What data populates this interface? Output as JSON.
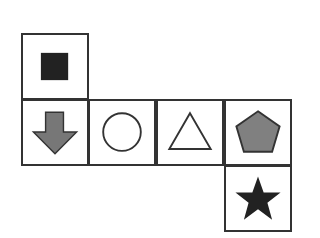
{
  "diagram": {
    "type": "shape-net",
    "cells": [
      {
        "shape": "square",
        "fill": "#222222",
        "position": "top-left"
      },
      {
        "shape": "down-arrow",
        "fill": "#777777",
        "position": "row2-col1"
      },
      {
        "shape": "circle",
        "fill": "none",
        "position": "row2-col2"
      },
      {
        "shape": "triangle",
        "fill": "none",
        "position": "row2-col3"
      },
      {
        "shape": "pentagon",
        "fill": "#808080",
        "position": "row2-col4"
      },
      {
        "shape": "star",
        "fill": "#222222",
        "position": "bottom-right"
      }
    ]
  }
}
